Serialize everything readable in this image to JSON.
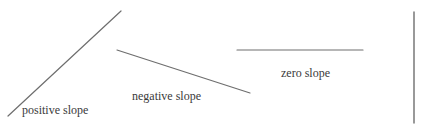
{
  "diagram": {
    "title": "",
    "line_color": "#6e6e6e",
    "text_color": "#3a3a3a",
    "lines": [
      {
        "id": "positive",
        "label": "positive slope",
        "x1": 8,
        "y1": 116,
        "x2": 121,
        "y2": 11,
        "label_x": 22,
        "label_y": 104
      },
      {
        "id": "negative",
        "label": "negative slope",
        "x1": 117,
        "y1": 50,
        "x2": 250,
        "y2": 93,
        "label_x": 132,
        "label_y": 90
      },
      {
        "id": "zero",
        "label": "zero slope",
        "x1": 237,
        "y1": 50,
        "x2": 363,
        "y2": 50,
        "label_x": 281,
        "label_y": 67
      },
      {
        "id": "vertical",
        "label": "",
        "x1": 414,
        "y1": 12,
        "x2": 414,
        "y2": 123
      }
    ]
  }
}
